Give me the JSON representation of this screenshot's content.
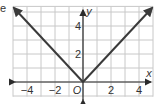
{
  "fragment_text": "e",
  "chart_data": {
    "type": "line",
    "title": "",
    "function": "y = |x|",
    "xlabel": "x",
    "ylabel": "y",
    "origin_label": "O",
    "xlim": [
      -5,
      5
    ],
    "ylim": [
      -1,
      5
    ],
    "grid": true,
    "x_tick_labels": [
      "-4",
      "-2",
      "2",
      "4"
    ],
    "y_tick_labels": [
      "2",
      "4"
    ],
    "series": [
      {
        "name": "y=|x|",
        "x": [
          -5,
          0,
          5
        ],
        "y": [
          5,
          0,
          5
        ],
        "color": "#3a3a3a",
        "arrows": true
      }
    ]
  },
  "colors": {
    "grid": "#c8c8c8",
    "axis": "#2b2b2b",
    "line": "#3a3a3a"
  }
}
